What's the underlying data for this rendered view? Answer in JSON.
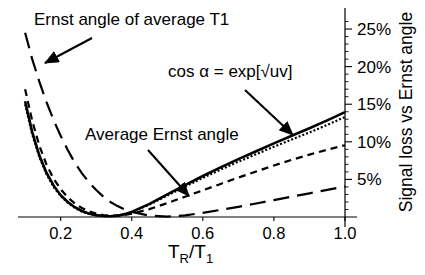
{
  "chart_data": {
    "type": "line",
    "title": "",
    "xlabel": "TR/T1",
    "xlabel_parts": {
      "base1": "T",
      "sub1": "R",
      "slash": "/",
      "base2": "T",
      "sub2": "1"
    },
    "ylabel": "Signal loss vs Ernst angle",
    "xlim": [
      0.08,
      1.0
    ],
    "ylim": [
      0,
      27
    ],
    "xticks": [
      0.2,
      0.4,
      0.6,
      0.8,
      1.0
    ],
    "xticklabels": [
      "0.2",
      "0.4",
      "0.6",
      "0.8",
      "1.0"
    ],
    "yticks": [
      5,
      10,
      15,
      20,
      25
    ],
    "yticklabels": [
      "5%",
      "10%",
      "15%",
      "20%",
      "25%"
    ],
    "yaxis_side": "right",
    "grid": false,
    "legend": "none",
    "series": [
      {
        "name": "solid-curve",
        "style": "solid",
        "x": [
          0.1,
          0.12,
          0.14,
          0.16,
          0.18,
          0.2,
          0.22,
          0.24,
          0.26,
          0.28,
          0.3,
          0.32,
          0.34,
          0.36,
          0.38,
          0.4,
          0.45,
          0.5,
          0.55,
          0.6,
          0.65,
          0.7,
          0.75,
          0.8,
          0.85,
          0.9,
          0.95,
          1.0
        ],
        "y": [
          15.4,
          11.3,
          8.2,
          5.9,
          4.2,
          2.9,
          2.0,
          1.3,
          0.8,
          0.45,
          0.25,
          0.13,
          0.1,
          0.18,
          0.38,
          0.68,
          1.75,
          3.0,
          4.25,
          5.45,
          6.6,
          7.7,
          8.75,
          9.8,
          10.8,
          11.8,
          12.85,
          13.95
        ]
      },
      {
        "name": "dotted-curve",
        "style": "dotted",
        "x": [
          0.1,
          0.12,
          0.14,
          0.16,
          0.18,
          0.2,
          0.22,
          0.24,
          0.26,
          0.28,
          0.3,
          0.32,
          0.34,
          0.36,
          0.38,
          0.4,
          0.45,
          0.5,
          0.55,
          0.6,
          0.65,
          0.7,
          0.75,
          0.8,
          0.85,
          0.9,
          0.95,
          1.0
        ],
        "y": [
          15.0,
          11.0,
          8.0,
          5.7,
          4.0,
          2.8,
          1.9,
          1.2,
          0.7,
          0.4,
          0.22,
          0.12,
          0.1,
          0.18,
          0.38,
          0.66,
          1.65,
          2.85,
          4.05,
          5.2,
          6.3,
          7.35,
          8.35,
          9.35,
          10.3,
          11.25,
          12.25,
          13.3
        ]
      },
      {
        "name": "short-dashed-curve",
        "style": "short-dash",
        "x": [
          0.1,
          0.12,
          0.14,
          0.16,
          0.18,
          0.2,
          0.22,
          0.24,
          0.26,
          0.28,
          0.3,
          0.32,
          0.34,
          0.36,
          0.38,
          0.4,
          0.45,
          0.5,
          0.55,
          0.6,
          0.65,
          0.7,
          0.75,
          0.8,
          0.85,
          0.9,
          0.95,
          1.0
        ],
        "y": [
          17.0,
          12.8,
          9.5,
          7.0,
          5.1,
          3.7,
          2.6,
          1.8,
          1.2,
          0.75,
          0.45,
          0.27,
          0.18,
          0.18,
          0.28,
          0.45,
          1.05,
          1.85,
          2.7,
          3.55,
          4.4,
          5.25,
          6.05,
          6.85,
          7.6,
          8.3,
          8.95,
          9.55
        ]
      },
      {
        "name": "long-dashed-curve",
        "style": "long-dash",
        "x": [
          0.1,
          0.12,
          0.14,
          0.16,
          0.18,
          0.2,
          0.22,
          0.24,
          0.26,
          0.28,
          0.3,
          0.32,
          0.34,
          0.36,
          0.38,
          0.4,
          0.45,
          0.5,
          0.55,
          0.6,
          0.65,
          0.7,
          0.75,
          0.8,
          0.85,
          0.9,
          0.95,
          1.0
        ],
        "y": [
          24.5,
          21.0,
          18.0,
          15.3,
          12.9,
          10.8,
          8.9,
          7.2,
          5.8,
          4.6,
          3.6,
          2.7,
          2.0,
          1.45,
          1.0,
          0.68,
          0.18,
          0.05,
          0.22,
          0.55,
          0.95,
          1.35,
          1.8,
          2.25,
          2.7,
          3.15,
          3.6,
          4.05
        ]
      }
    ],
    "annotations": [
      {
        "name": "ernst-angle-of-average-t1",
        "text": "Ernst angle of average T1",
        "text_x": 34,
        "text_y": 25,
        "arrow_from_x": 92,
        "arrow_from_y": 38,
        "arrow_to_x": 45,
        "arrow_to_y": 63
      },
      {
        "name": "cos-alpha-formula",
        "text": "cos α = exp[√uv]",
        "text_x": 168,
        "text_y": 77,
        "arrow_from_x": 245,
        "arrow_from_y": 90,
        "arrow_to_x": 293,
        "arrow_to_y": 135
      },
      {
        "name": "average-ernst-angle",
        "text": "Average  Ernst angle",
        "text_x": 85,
        "text_y": 140,
        "arrow_from_x": 148,
        "arrow_from_y": 150,
        "arrow_to_x": 189,
        "arrow_to_y": 196
      }
    ]
  }
}
